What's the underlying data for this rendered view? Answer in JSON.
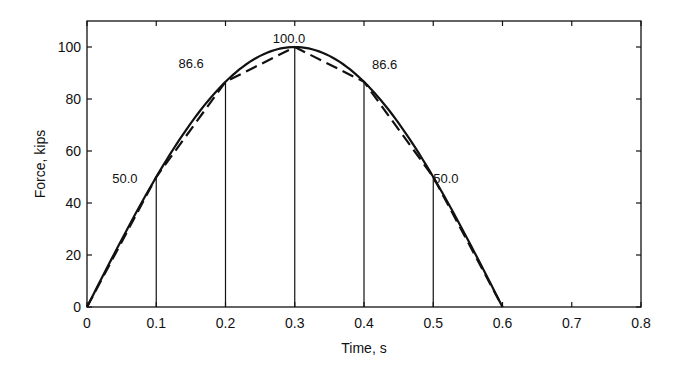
{
  "chart_data": {
    "type": "line",
    "title": "",
    "xlabel": "Time, s",
    "ylabel": "Force, kips",
    "xlim": [
      0,
      0.8
    ],
    "ylim": [
      0,
      110
    ],
    "xticks": [
      0,
      0.1,
      0.2,
      0.3,
      0.4,
      0.5,
      0.6,
      0.7,
      0.8
    ],
    "xtick_labels": [
      "0",
      "0.1",
      "0.2",
      "0.3",
      "0.4",
      "0.5",
      "0.6",
      "0.7",
      "0.8"
    ],
    "yticks": [
      0,
      20,
      40,
      60,
      80,
      100
    ],
    "ytick_labels": [
      "0",
      "20",
      "40",
      "60",
      "80",
      "100"
    ],
    "grid": false,
    "legend": null,
    "series": [
      {
        "name": "Exact half-sine force",
        "style": "solid",
        "function": "100*sin(pi*t/0.6)",
        "x": [
          0,
          0.05,
          0.1,
          0.15,
          0.2,
          0.25,
          0.3,
          0.35,
          0.4,
          0.45,
          0.5,
          0.55,
          0.6
        ],
        "values": [
          0,
          25.9,
          50.0,
          70.7,
          86.6,
          96.6,
          100.0,
          96.6,
          86.6,
          70.7,
          50.0,
          25.9,
          0
        ]
      },
      {
        "name": "Piecewise-linear approximation",
        "style": "dashed",
        "x": [
          0,
          0.1,
          0.2,
          0.3,
          0.4,
          0.5,
          0.6
        ],
        "values": [
          0,
          50.0,
          86.6,
          100.0,
          86.6,
          50.0,
          0
        ]
      }
    ],
    "vertical_lines": [
      {
        "x": 0.1,
        "y": 50.0
      },
      {
        "x": 0.2,
        "y": 86.6
      },
      {
        "x": 0.3,
        "y": 100.0
      },
      {
        "x": 0.4,
        "y": 86.6
      },
      {
        "x": 0.5,
        "y": 50.0
      }
    ],
    "annotations": [
      {
        "text": "50.0",
        "x": 0.1,
        "y": 50.0
      },
      {
        "text": "86.6",
        "x": 0.2,
        "y": 86.6
      },
      {
        "text": "100.0",
        "x": 0.3,
        "y": 100.0
      },
      {
        "text": "86.6",
        "x": 0.4,
        "y": 86.6
      },
      {
        "text": "50.0",
        "x": 0.5,
        "y": 50.0
      }
    ]
  },
  "colors": {
    "line": "#111111",
    "background": "#ffffff"
  }
}
